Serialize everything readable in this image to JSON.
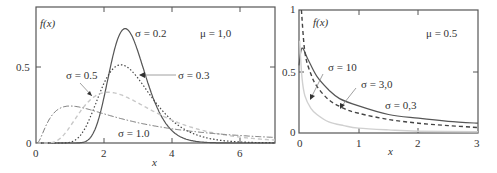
{
  "chart_data": [
    {
      "type": "line",
      "title": "",
      "xlabel": "x",
      "ylabel": "f(x)",
      "annotation": "μ = 1,0",
      "xlim": [
        0,
        7
      ],
      "ylim": [
        0,
        0.89
      ],
      "xticks": [
        "0",
        "2",
        "4",
        "6"
      ],
      "yticks": [
        "0",
        "0.5"
      ],
      "grid": false,
      "legend": "inline labels",
      "series": [
        {
          "name": "σ = 0.2",
          "style": "solid",
          "color": "#555555",
          "mu": 1.0,
          "sigma": 0.2,
          "x": [
            0.5,
            1.0,
            1.5,
            2.0,
            2.2,
            2.4,
            2.6,
            2.8,
            3.0,
            3.2,
            3.5,
            4.0,
            4.5,
            5.0,
            6.0,
            7.0
          ],
          "values": [
            0.0,
            0.0,
            0.02,
            0.21,
            0.38,
            0.57,
            0.74,
            0.7,
            0.58,
            0.43,
            0.24,
            0.06,
            0.01,
            0.0,
            0.0,
            0.0
          ]
        },
        {
          "name": "σ = 0.3",
          "style": "dotted",
          "color": "#444444",
          "mu": 1.0,
          "sigma": 0.3,
          "x": [
            0.5,
            1.0,
            1.5,
            2.0,
            2.4,
            2.8,
            3.2,
            3.6,
            4.0,
            4.5,
            5.0,
            6.0,
            7.0
          ],
          "values": [
            0.0,
            0.01,
            0.12,
            0.38,
            0.51,
            0.49,
            0.38,
            0.26,
            0.16,
            0.08,
            0.04,
            0.01,
            0.0
          ]
        },
        {
          "name": "σ = 0.5",
          "style": "dashed",
          "color": "#c8c8c8",
          "mu": 1.0,
          "sigma": 0.5,
          "x": [
            0.5,
            1.0,
            1.5,
            2.0,
            2.5,
            3.0,
            3.5,
            4.0,
            5.0,
            6.0,
            7.0
          ],
          "values": [
            0.01,
            0.09,
            0.24,
            0.33,
            0.32,
            0.26,
            0.19,
            0.13,
            0.06,
            0.03,
            0.01
          ]
        },
        {
          "name": "σ = 1.0",
          "style": "dashdot",
          "color": "#777777",
          "mu": 1.0,
          "sigma": 1.0,
          "x": [
            0.1,
            0.3,
            0.5,
            1.0,
            1.5,
            2.0,
            3.0,
            4.0,
            5.0,
            6.0,
            7.0
          ],
          "values": [
            0.02,
            0.13,
            0.2,
            0.24,
            0.22,
            0.19,
            0.13,
            0.09,
            0.06,
            0.045,
            0.033
          ]
        }
      ]
    },
    {
      "type": "line",
      "title": "",
      "xlabel": "x",
      "ylabel": "f(x)",
      "annotation": "μ = 0.5",
      "xlim": [
        0,
        3
      ],
      "ylim": [
        0,
        1
      ],
      "xticks": [
        "0",
        "1",
        "2",
        "3"
      ],
      "yticks": [
        "0",
        "0.5",
        "1"
      ],
      "grid": false,
      "legend": "inline labels",
      "series": [
        {
          "name": "σ = 0,3",
          "style": "solid",
          "color": "#555555",
          "x": [
            0.0,
            0.05,
            0.15,
            0.3,
            0.5,
            0.68,
            1.0,
            1.5,
            2.0,
            2.5,
            3.0
          ],
          "values": [
            0.55,
            0.69,
            0.6,
            0.46,
            0.35,
            0.28,
            0.22,
            0.15,
            0.12,
            0.095,
            0.08
          ]
        },
        {
          "name": "σ = 3,0",
          "style": "dashed",
          "color": "#444444",
          "x": [
            0.04,
            0.1,
            0.2,
            0.3,
            0.5,
            0.75,
            1.0,
            1.5,
            2.0,
            2.5,
            3.0
          ],
          "values": [
            1.0,
            0.65,
            0.48,
            0.38,
            0.27,
            0.2,
            0.16,
            0.11,
            0.08,
            0.06,
            0.045
          ]
        },
        {
          "name": "σ = 10",
          "style": "solid-light",
          "color": "#d0d0d0",
          "x": [
            0.01,
            0.05,
            0.1,
            0.2,
            0.3,
            0.5,
            0.75,
            1.0,
            1.5,
            2.0,
            3.0
          ],
          "values": [
            0.75,
            0.45,
            0.3,
            0.2,
            0.15,
            0.09,
            0.06,
            0.04,
            0.025,
            0.015,
            0.01
          ]
        }
      ]
    }
  ],
  "left": {
    "ylabel": "f(x)",
    "xlabel": "x",
    "mu_label": "μ = 1,0",
    "labels": {
      "s02": "σ = 0.2",
      "s03": "σ = 0.3",
      "s05": "σ = 0.5",
      "s10": "σ = 1.0"
    },
    "yticks": {
      "t0": "0",
      "t05": "0.5"
    },
    "xticks": {
      "t0": "0",
      "t2": "2",
      "t4": "4",
      "t6": "6"
    }
  },
  "right": {
    "ylabel": "f(x)",
    "xlabel": "x",
    "mu_label": "μ = 0.5",
    "labels": {
      "s10": "σ = 10",
      "s30": "σ = 3,0",
      "s03": "σ = 0,3"
    },
    "yticks": {
      "t0": "0",
      "t05": "0.5",
      "t1": "1"
    },
    "xticks": {
      "t0": "0",
      "t1": "1",
      "t2": "2",
      "t3": "3"
    }
  }
}
